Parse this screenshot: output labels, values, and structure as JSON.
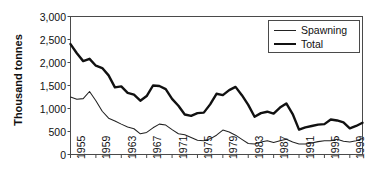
{
  "chart_data": {
    "type": "line",
    "title": "",
    "xlabel": "",
    "ylabel": "Thousand tonnes",
    "ylim": [
      0,
      3000
    ],
    "xlim": [
      1955,
      2001
    ],
    "yticks": [
      "0",
      "500",
      "1,000",
      "1,500",
      "2,000",
      "2,500",
      "3,000"
    ],
    "ytick_values": [
      0,
      500,
      1000,
      1500,
      2000,
      2500,
      3000
    ],
    "xticks": [
      "1955",
      "1959",
      "1963",
      "1967",
      "1971",
      "1975",
      "1979",
      "1983",
      "1987",
      "1991",
      "1995",
      "1999"
    ],
    "xtick_values": [
      1955,
      1959,
      1963,
      1967,
      1971,
      1975,
      1979,
      1983,
      1987,
      1991,
      1995,
      1999
    ],
    "grid": false,
    "legend_position": "top-right",
    "x": [
      1955,
      1956,
      1957,
      1958,
      1959,
      1960,
      1961,
      1962,
      1963,
      1964,
      1965,
      1966,
      1967,
      1968,
      1969,
      1970,
      1971,
      1972,
      1973,
      1974,
      1975,
      1976,
      1977,
      1978,
      1979,
      1980,
      1981,
      1982,
      1983,
      1984,
      1985,
      1986,
      1987,
      1988,
      1989,
      1990,
      1991,
      1992,
      1993,
      1994,
      1995,
      1996,
      1997,
      1998,
      1999,
      2000,
      2001
    ],
    "series": [
      {
        "name": "Total",
        "style": "thick",
        "color": "#111111",
        "values": [
          2400,
          2200,
          2030,
          2080,
          1930,
          1880,
          1720,
          1460,
          1480,
          1340,
          1300,
          1170,
          1270,
          1500,
          1490,
          1420,
          1210,
          1060,
          870,
          840,
          900,
          910,
          1090,
          1320,
          1290,
          1400,
          1470,
          1290,
          1080,
          820,
          900,
          930,
          890,
          1020,
          1110,
          880,
          540,
          590,
          620,
          650,
          660,
          760,
          740,
          700,
          570,
          620,
          690
        ]
      },
      {
        "name": "Spawning",
        "style": "thin",
        "color": "#222222",
        "values": [
          1250,
          1200,
          1215,
          1370,
          1170,
          940,
          790,
          730,
          660,
          600,
          560,
          450,
          480,
          580,
          660,
          640,
          540,
          450,
          430,
          370,
          310,
          300,
          340,
          420,
          530,
          490,
          420,
          330,
          240,
          230,
          270,
          300,
          260,
          300,
          330,
          270,
          230,
          230,
          250,
          280,
          300,
          300,
          330,
          290,
          270,
          300,
          350
        ]
      }
    ],
    "legend": [
      {
        "label": "Spawning",
        "style": "thin"
      },
      {
        "label": "Total",
        "style": "thick"
      }
    ]
  },
  "axis": {
    "y_title": "Thousand tonnes"
  }
}
